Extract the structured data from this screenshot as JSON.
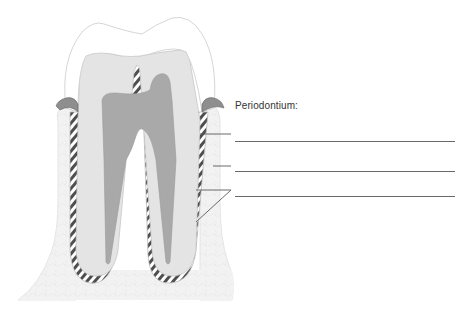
{
  "title": "Periodontium:",
  "colors": {
    "background": "#ffffff",
    "enamel_fill": "#ffffff",
    "enamel_stroke": "#c9c9c9",
    "dentin": "#e4e4e4",
    "pulp": "#a9a9a9",
    "bone": "#f1f1f1",
    "bone_stroke": "#e2e2e2",
    "ligament_dark": "#555555",
    "ligament_light": "#ffffff",
    "gingiva": "#8c8c8c",
    "leader": "#5a5a5a"
  },
  "answer_lines": [
    {
      "index": 1,
      "value": ""
    },
    {
      "index": 2,
      "value": ""
    },
    {
      "index": 3,
      "value": ""
    }
  ],
  "structures": [
    {
      "name": "enamel"
    },
    {
      "name": "dentin"
    },
    {
      "name": "pulp"
    },
    {
      "name": "gingiva"
    },
    {
      "name": "periodontal-ligament"
    },
    {
      "name": "alveolar-bone"
    }
  ]
}
